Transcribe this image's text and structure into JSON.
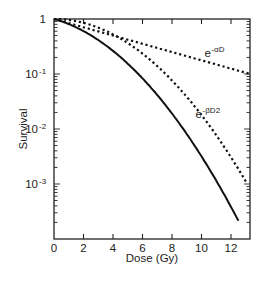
{
  "chart_data": {
    "type": "line",
    "title": "",
    "xlabel": "Dose (Gy)",
    "ylabel": "Survival",
    "xscale": "linear",
    "yscale": "log",
    "xlim": [
      0,
      13.3
    ],
    "ylim": [
      0.0001,
      1
    ],
    "grid": false,
    "x_ticks": [
      0,
      2,
      4,
      6,
      8,
      10,
      12
    ],
    "x_tick_labels": [
      "0",
      "2",
      "4",
      "6",
      "8",
      "10",
      "12"
    ],
    "y_ticks": [
      1,
      0.1,
      0.01,
      0.001
    ],
    "y_tick_labels": [
      {
        "base": "1",
        "exp": ""
      },
      {
        "base": "10",
        "exp": "-1"
      },
      {
        "base": "10",
        "exp": "-2"
      },
      {
        "base": "10",
        "exp": "-3"
      }
    ],
    "series": [
      {
        "name": "linear-quadratic (combined)",
        "style": "solid",
        "alpha": 0.173,
        "beta": 0.0402,
        "x_end": 12.5,
        "x": [
          0,
          2,
          4,
          6,
          8,
          10,
          12,
          12.5
        ],
        "values": [
          1,
          0.6,
          0.26,
          0.087,
          0.019,
          0.0032,
          0.00039,
          0.00025
        ]
      },
      {
        "name": "e^-αD",
        "style": "dotted",
        "alpha": 0.173,
        "beta": 0,
        "x_end": 13.3,
        "x": [
          0,
          2,
          4,
          6,
          8,
          10,
          12,
          13.3
        ],
        "values": [
          1,
          0.71,
          0.5,
          0.35,
          0.25,
          0.18,
          0.125,
          0.1
        ]
      },
      {
        "name": "e^-βD2",
        "style": "dotted",
        "alpha": 0,
        "beta": 0.0402,
        "x_end": 13.1,
        "x": [
          0,
          2,
          4,
          6,
          8,
          10,
          12,
          13.1
        ],
        "values": [
          1,
          0.85,
          0.53,
          0.24,
          0.076,
          0.018,
          0.0031,
          0.001
        ]
      }
    ],
    "annotations": [
      {
        "id": "alpha",
        "base": "e",
        "exp": "-αD",
        "x": 10.2,
        "y": 0.2
      },
      {
        "id": "beta",
        "base": "e",
        "exp": "-βD2",
        "x": 9.6,
        "y": 0.016
      }
    ]
  },
  "axes": {
    "x_label": "Dose (Gy)",
    "y_label": "Survival"
  }
}
